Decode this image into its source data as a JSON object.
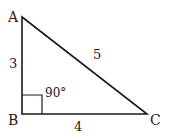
{
  "diagram": {
    "type": "right-triangle",
    "vertices": [
      {
        "name": "A",
        "label": "A"
      },
      {
        "name": "B",
        "label": "B"
      },
      {
        "name": "C",
        "label": "C"
      }
    ],
    "sides": {
      "AB": "3",
      "BC": "4",
      "AC": "5"
    },
    "angle_label": "90°",
    "colors": {
      "stroke": "#1a1a1a",
      "background": "#ffffff"
    }
  }
}
